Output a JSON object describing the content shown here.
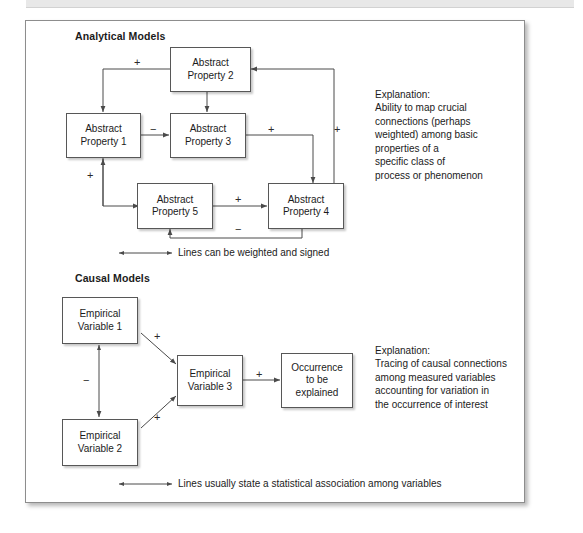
{
  "figure": {
    "sections": [
      {
        "id": "analytical",
        "title": "Analytical Models",
        "nodes": [
          {
            "id": "ap1",
            "line1": "Abstract",
            "line2": "Property 1"
          },
          {
            "id": "ap2",
            "line1": "Abstract",
            "line2": "Property 2"
          },
          {
            "id": "ap3",
            "line1": "Abstract",
            "line2": "Property 3"
          },
          {
            "id": "ap4",
            "line1": "Abstract",
            "line2": "Property 4"
          },
          {
            "id": "ap5",
            "line1": "Abstract",
            "line2": "Property 5"
          }
        ],
        "signs": [
          {
            "id": "s-ap2-ap1",
            "label": "+"
          },
          {
            "id": "s-ap1-ap3",
            "label": "−"
          },
          {
            "id": "s-ap3-ap4",
            "label": "+"
          },
          {
            "id": "s-ap4-ap2",
            "label": "+"
          },
          {
            "id": "s-ap1-ap5",
            "label": "+"
          },
          {
            "id": "s-ap5-ap4",
            "label": "+"
          },
          {
            "id": "s-ap4-ap5",
            "label": "−"
          }
        ],
        "explanation": {
          "heading": "Explanation:",
          "body": "Ability to map crucial\nconnections (perhaps\nweighted) among basic\nproperties of a\nspecific class of\nprocess or phenomenon"
        },
        "caption": "Lines can be weighted and signed"
      },
      {
        "id": "causal",
        "title": "Causal Models",
        "nodes": [
          {
            "id": "ev1",
            "line1": "Empirical",
            "line2": "Variable 1"
          },
          {
            "id": "ev2",
            "line1": "Empirical",
            "line2": "Variable 2"
          },
          {
            "id": "ev3",
            "line1": "Empirical",
            "line2": "Variable 3"
          },
          {
            "id": "occ",
            "line1": "Occurrence",
            "line2": "to be",
            "line3": "explained"
          }
        ],
        "signs": [
          {
            "id": "s-ev1-ev3",
            "label": "+"
          },
          {
            "id": "s-ev2-ev3",
            "label": "+"
          },
          {
            "id": "s-ev1-ev2",
            "label": "−"
          },
          {
            "id": "s-ev3-occ",
            "label": "+"
          }
        ],
        "explanation": {
          "heading": "Explanation:",
          "body": "Tracing of causal connections\namong measured variables\naccounting for variation in\nthe occurrence of interest"
        },
        "caption": "Lines usually state a statistical association among variables"
      }
    ],
    "colors": {
      "node_border": "#575757",
      "line": "#4a4a4a",
      "text": "#1b1b1b",
      "frame_border": "#8d8d8d",
      "topbar": "#e8e8e8"
    }
  }
}
